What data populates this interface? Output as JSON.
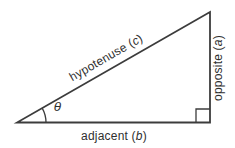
{
  "figure": {
    "angle": {
      "symbol": "θ"
    },
    "sides": {
      "hypotenuse": {
        "prefix": "hypotenuse (",
        "variable": "c",
        "suffix": ")"
      },
      "opposite": {
        "prefix": "opposite (",
        "variable": "a",
        "suffix": ")"
      },
      "adjacent": {
        "prefix": "adjacent (",
        "variable": "b",
        "suffix": ")"
      }
    },
    "colors": {
      "line": "#3c3c3c",
      "text": "#2f2f2f",
      "background": "#ffffff"
    }
  }
}
